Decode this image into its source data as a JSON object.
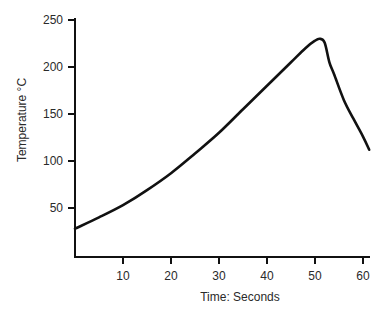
{
  "chart_data": {
    "type": "line",
    "title": "",
    "xlabel": "Time: Seconds",
    "ylabel": "Temperature °C",
    "xlim": [
      0,
      61.5
    ],
    "ylim": [
      0,
      255
    ],
    "grid": false,
    "legend": null,
    "xticks": [
      10,
      20,
      30,
      40,
      50,
      60
    ],
    "yticks": [
      50,
      100,
      150,
      200,
      250
    ],
    "series": [
      {
        "name": "Temperature",
        "x": [
          0,
          5,
          10,
          15,
          20,
          25,
          30,
          35,
          40,
          45,
          48,
          50,
          51,
          52,
          53,
          54,
          56,
          58,
          60,
          61.3
        ],
        "y": [
          28,
          40,
          53,
          69,
          87,
          108,
          130,
          155,
          180,
          205,
          220,
          228,
          230,
          226,
          205,
          192,
          165,
          145,
          126,
          112
        ]
      }
    ]
  },
  "labels": {
    "xlabel": "Time: Seconds",
    "ylabel": "Temperature °C"
  },
  "ticks": {
    "x": [
      "10",
      "20",
      "30",
      "40",
      "50",
      "60"
    ],
    "y": [
      "50",
      "100",
      "150",
      "200",
      "250"
    ]
  }
}
